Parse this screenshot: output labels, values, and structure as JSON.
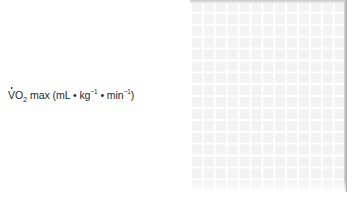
{
  "chart_data": {
    "type": "line",
    "title": "",
    "xlabel": "",
    "ylabel": "V̇O2 max (mL • kg⁻¹ • min⁻¹)",
    "ylabel_parts": {
      "main": "V",
      "sub_o": "O",
      "sub_2": "2",
      "rest1": " max (mL • kg",
      "sup1": "−1",
      "rest2": " • min",
      "sup2": "−1",
      "close": ")"
    },
    "series": [],
    "grid": true,
    "legend": null,
    "note": "Empty plotting grid; no data points visible"
  }
}
